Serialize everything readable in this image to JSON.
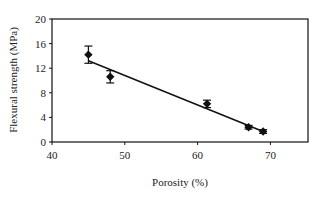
{
  "chart_data": {
    "type": "scatter",
    "title": "",
    "xlabel": "Porosity (%)",
    "ylabel": "Flexural strength (MPa)",
    "xlim": [
      40,
      75
    ],
    "ylim": [
      0,
      20
    ],
    "xticks": [
      40,
      50,
      60,
      70
    ],
    "yticks": [
      0,
      4,
      8,
      12,
      16,
      20
    ],
    "grid": false,
    "legend": null,
    "series": [
      {
        "name": "measured",
        "marker": "diamond",
        "points": [
          {
            "x": 45.0,
            "y": 14.2,
            "err": 1.4
          },
          {
            "x": 48.0,
            "y": 10.6,
            "err": 1.0
          },
          {
            "x": 61.3,
            "y": 6.2,
            "err": 0.6
          },
          {
            "x": 67.0,
            "y": 2.4,
            "err": 0.3
          },
          {
            "x": 69.0,
            "y": 1.7,
            "err": 0.3
          }
        ]
      }
    ],
    "trendline": {
      "type": "linear",
      "x": [
        45.0,
        69.0
      ],
      "y": [
        13.2,
        1.7
      ]
    }
  },
  "labels": {
    "x_ticks": [
      "40",
      "50",
      "60",
      "70"
    ],
    "y_ticks": [
      "0",
      "4",
      "8",
      "12",
      "16",
      "20"
    ],
    "xlabel": "Porosity (%)",
    "ylabel": "Flexural strength (MPa)"
  }
}
